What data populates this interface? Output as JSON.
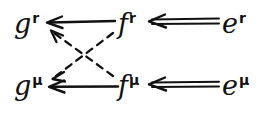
{
  "canvas": {
    "width": 263,
    "height": 115,
    "background": "#ffffff",
    "ink_color": "#111111",
    "style": "handwritten-commutative-diagram"
  },
  "diagram": {
    "title": "",
    "nodes": [
      {
        "id": "g-r",
        "base": "g",
        "superscript": "r",
        "label": "gʳ",
        "row": "top",
        "col": "left"
      },
      {
        "id": "f-r",
        "base": "f",
        "superscript": "r",
        "label": "fʳ",
        "row": "top",
        "col": "middle"
      },
      {
        "id": "e-r",
        "base": "e",
        "superscript": "r",
        "label": "eʳ",
        "row": "top",
        "col": "right"
      },
      {
        "id": "g-mu",
        "base": "g",
        "superscript": "μ",
        "label": "gᵟ",
        "row": "bottom",
        "col": "left"
      },
      {
        "id": "f-mu",
        "base": "f",
        "superscript": "μ",
        "label": "fᵟ",
        "row": "bottom",
        "col": "middle"
      },
      {
        "id": "e-mu",
        "base": "e",
        "superscript": "μ",
        "label": "eᵟ",
        "row": "bottom",
        "col": "right"
      }
    ],
    "edges": [
      {
        "id": "edge-fr-to-gr",
        "from": "f-r",
        "to": "g-r",
        "style": "solid",
        "stroke": "single",
        "direction": "left",
        "arrowhead": "open"
      },
      {
        "id": "edge-er-to-fr",
        "from": "e-r",
        "to": "f-r",
        "style": "solid",
        "stroke": "double",
        "direction": "left",
        "arrowhead": "open"
      },
      {
        "id": "edge-fmu-to-gmu",
        "from": "f-mu",
        "to": "g-mu",
        "style": "solid",
        "stroke": "single",
        "direction": "left",
        "arrowhead": "open"
      },
      {
        "id": "edge-emu-to-fmu",
        "from": "e-mu",
        "to": "f-mu",
        "style": "solid",
        "stroke": "double",
        "direction": "left",
        "arrowhead": "open"
      },
      {
        "id": "edge-fmu-to-gr",
        "from": "f-mu",
        "to": "g-r",
        "style": "dashed",
        "stroke": "single",
        "direction": "up-left",
        "arrowhead": "open"
      },
      {
        "id": "edge-fr-to-gmu",
        "from": "f-r",
        "to": "g-mu",
        "style": "dashed",
        "stroke": "single",
        "direction": "down-left",
        "arrowhead": "open"
      }
    ]
  }
}
